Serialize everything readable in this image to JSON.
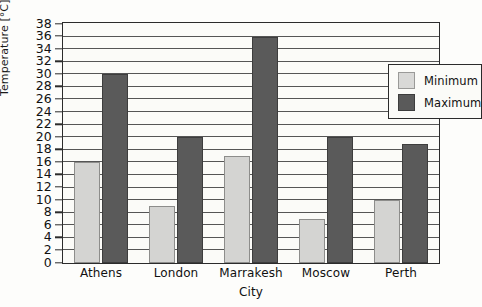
{
  "chart_data": {
    "type": "bar",
    "title": "",
    "xlabel": "City",
    "ylabel": "Temperature [°C]",
    "categories": [
      "Athens",
      "London",
      "Marrakesh",
      "Moscow",
      "Perth"
    ],
    "series": [
      {
        "name": "Minimum",
        "color": "#d4d4d2",
        "values": [
          16,
          9,
          17,
          7,
          10
        ]
      },
      {
        "name": "Maximum",
        "color": "#5a5a5a",
        "values": [
          30,
          20,
          36,
          20,
          19
        ]
      }
    ],
    "ylim": [
      0,
      38
    ],
    "ytick_step": 2,
    "yticks": [
      0,
      2,
      4,
      6,
      8,
      10,
      12,
      14,
      16,
      18,
      20,
      22,
      24,
      26,
      28,
      30,
      32,
      34,
      36,
      38
    ],
    "ytick_labels": [
      "0",
      "2",
      "4",
      "6",
      "8",
      "10",
      "12",
      "14",
      "16",
      "18",
      "20",
      "22",
      "24",
      "26",
      "28",
      "30",
      "32",
      "34",
      "36",
      "38"
    ],
    "grid": "horizontal",
    "legend_position": "upper right inside plot"
  },
  "legend": {
    "entries": [
      {
        "label": "Minimum",
        "swatch": "min"
      },
      {
        "label": "Maximum",
        "swatch": "max"
      }
    ]
  }
}
